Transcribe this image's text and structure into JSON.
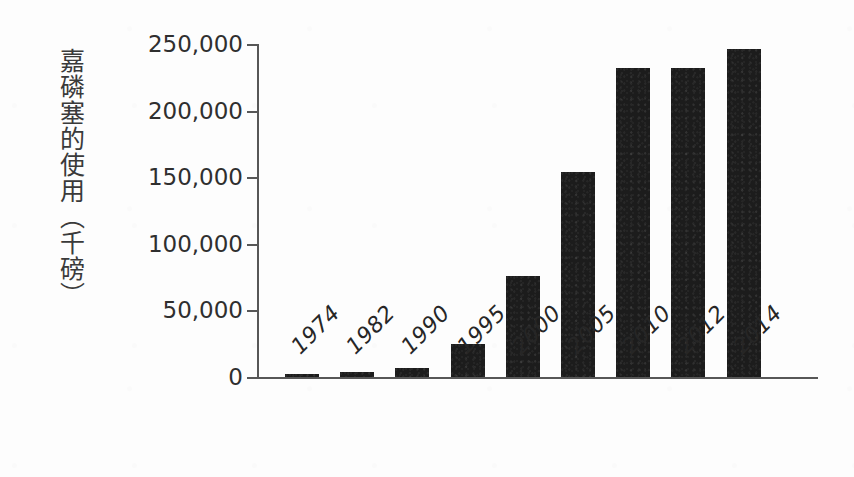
{
  "chart_data": {
    "type": "bar",
    "title": "",
    "xlabel": "",
    "ylabel": "嘉磷塞的使用（千磅）",
    "categories": [
      "1974",
      "1982",
      "1990",
      "1995",
      "2000",
      "2005",
      "2010",
      "2012",
      "2014"
    ],
    "values": [
      2000,
      4000,
      6500,
      25000,
      76000,
      154000,
      232000,
      232000,
      246000
    ],
    "ylim": [
      0,
      250000
    ],
    "ytick_labels": [
      "0",
      "50,000",
      "100,000",
      "150,000",
      "200,000",
      "250,000"
    ],
    "ytick_values": [
      0,
      50000,
      100000,
      150000,
      200000,
      250000
    ],
    "grid": false,
    "legend": false,
    "bar_color": "#1c1c1c",
    "axis_color": "#575757",
    "background_color": "#fdfdfd"
  },
  "axis": {
    "y_title": "嘉磷塞的使用（千磅）"
  }
}
